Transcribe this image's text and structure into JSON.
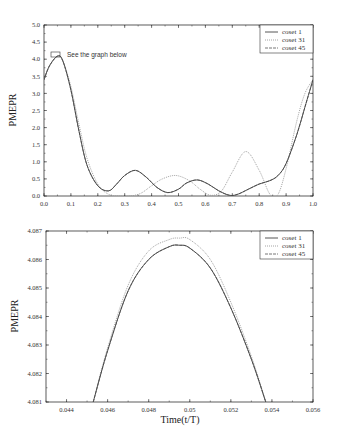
{
  "chart_data": [
    {
      "type": "line",
      "title": "",
      "xlabel": "",
      "ylabel": "PMEPR",
      "xlim": [
        0.0,
        1.0
      ],
      "ylim": [
        0.0,
        5.0
      ],
      "xticks": [
        "0.0",
        "0.1",
        "0.2",
        "0.3",
        "0.4",
        "0.5",
        "0.6",
        "0.7",
        "0.8",
        "0.9",
        "1.0"
      ],
      "yticks": [
        "0.0",
        "0.5",
        "1.0",
        "1.5",
        "2.0",
        "2.5",
        "3.0",
        "3.5",
        "4.0",
        "4.5",
        "5.0"
      ],
      "grid": false,
      "legend_position": "upper right",
      "annotation": "See the graph below",
      "annotation_box": {
        "x": [
          0.035,
          0.065
        ],
        "y": [
          4.0,
          4.15
        ]
      },
      "series": [
        {
          "name": "coset 1",
          "style": "solid",
          "x": [
            0.0,
            0.02,
            0.05,
            0.07,
            0.1,
            0.13,
            0.16,
            0.2,
            0.24,
            0.27,
            0.3,
            0.34,
            0.38,
            0.42,
            0.46,
            0.5,
            0.53,
            0.57,
            0.61,
            0.65,
            0.69,
            0.72,
            0.76,
            0.8,
            0.84,
            0.87,
            0.9,
            0.94,
            0.97,
            1.0
          ],
          "values": [
            3.4,
            3.8,
            4.09,
            3.95,
            3.1,
            1.9,
            0.9,
            0.3,
            0.15,
            0.35,
            0.6,
            0.75,
            0.55,
            0.25,
            0.1,
            0.2,
            0.38,
            0.47,
            0.35,
            0.15,
            0.02,
            0.05,
            0.2,
            0.35,
            0.45,
            0.6,
            0.95,
            1.8,
            2.6,
            3.4
          ]
        },
        {
          "name": "coset 31",
          "style": "dotted",
          "x": [
            0.0,
            0.02,
            0.05,
            0.07,
            0.1,
            0.13,
            0.16,
            0.2,
            0.24,
            0.28,
            0.32,
            0.36,
            0.4,
            0.44,
            0.49,
            0.54,
            0.58,
            0.62,
            0.66,
            0.7,
            0.75,
            0.8,
            0.84,
            0.87,
            0.9,
            0.94,
            0.97,
            1.0
          ],
          "values": [
            3.4,
            3.8,
            4.09,
            3.95,
            3.2,
            2.1,
            1.1,
            0.35,
            0.05,
            0.0,
            0.0,
            0.08,
            0.3,
            0.5,
            0.6,
            0.45,
            0.2,
            0.02,
            0.15,
            0.7,
            1.3,
            0.75,
            0.05,
            0.05,
            0.8,
            2.2,
            3.0,
            3.4
          ]
        },
        {
          "name": "coset 45",
          "style": "dashed",
          "x": [
            0.0,
            0.02,
            0.05,
            0.07,
            0.1,
            0.13,
            0.16,
            0.2,
            0.24,
            0.27,
            0.3,
            0.34,
            0.38,
            0.42,
            0.46,
            0.5,
            0.53,
            0.57,
            0.61,
            0.65,
            0.69,
            0.72,
            0.76,
            0.8,
            0.84,
            0.87,
            0.9,
            0.94,
            0.97,
            1.0
          ],
          "values": [
            3.4,
            3.8,
            4.09,
            3.95,
            3.1,
            1.9,
            0.9,
            0.3,
            0.15,
            0.35,
            0.6,
            0.75,
            0.55,
            0.25,
            0.1,
            0.2,
            0.38,
            0.47,
            0.35,
            0.15,
            0.02,
            0.05,
            0.2,
            0.35,
            0.45,
            0.6,
            0.95,
            1.8,
            2.6,
            3.4
          ]
        }
      ]
    },
    {
      "type": "line",
      "title": "",
      "xlabel": "Time(t/T)",
      "ylabel": "PMEPR",
      "xlim": [
        0.043,
        0.056
      ],
      "ylim": [
        4.081,
        4.087
      ],
      "xticks": [
        "0.044",
        "0.046",
        "0.048",
        "0.05",
        "0.052",
        "0.054",
        "0.056"
      ],
      "yticks": [
        "4.081",
        "4.082",
        "4.083",
        "4.084",
        "4.085",
        "4.086",
        "4.087"
      ],
      "grid": false,
      "legend_position": "upper right",
      "series": [
        {
          "name": "coset 1",
          "style": "solid",
          "x": [
            0.0453,
            0.046,
            0.047,
            0.048,
            0.049,
            0.0495,
            0.05,
            0.051,
            0.052,
            0.053,
            0.0537
          ],
          "values": [
            4.081,
            4.0828,
            4.0849,
            4.086,
            4.08645,
            4.0865,
            4.0864,
            4.0857,
            4.0843,
            4.0825,
            4.081
          ]
        },
        {
          "name": "coset 31",
          "style": "dotted",
          "x": [
            0.0453,
            0.046,
            0.047,
            0.048,
            0.049,
            0.0495,
            0.05,
            0.051,
            0.052,
            0.053,
            0.0537
          ],
          "values": [
            4.081,
            4.0829,
            4.0851,
            4.0863,
            4.0867,
            4.08675,
            4.0867,
            4.086,
            4.0845,
            4.0826,
            4.081
          ]
        },
        {
          "name": "coset 45",
          "style": "dashed",
          "x": [
            0.0453,
            0.046,
            0.047,
            0.048,
            0.049,
            0.0495,
            0.05,
            0.051,
            0.052,
            0.053,
            0.0537
          ],
          "values": [
            4.081,
            4.0828,
            4.0849,
            4.086,
            4.08645,
            4.0865,
            4.0864,
            4.0857,
            4.0843,
            4.0825,
            4.081
          ]
        }
      ]
    }
  ],
  "top": {
    "ylabel": "PMEPR",
    "annotation": "See the graph below",
    "legend": [
      "coset 1",
      "coset 31",
      "coset 45"
    ]
  },
  "bottom": {
    "ylabel": "PMEPR",
    "xlabel": "Time(t/T)",
    "legend": [
      "coset 1",
      "coset 31",
      "coset 45"
    ]
  },
  "colors": {
    "coset1": "#444444",
    "coset31": "#9a9a9a",
    "coset45": "#666666",
    "axis": "#333333"
  }
}
